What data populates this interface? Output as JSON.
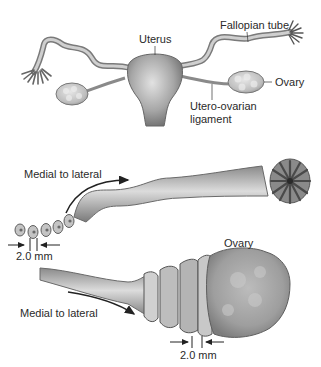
{
  "top_panel": {
    "labels": {
      "uterus": "Uterus",
      "fallopian_tube": "Fallopian tube",
      "ovary": "Ovary",
      "ligament_line1": "Utero-ovarian",
      "ligament_line2": "ligament"
    }
  },
  "middle_panel": {
    "direction_label": "Medial to lateral",
    "section_thickness": "2.0 mm"
  },
  "bottom_panel": {
    "ovary_label": "Ovary",
    "direction_label": "Medial to lateral",
    "section_thickness": "2.0 mm"
  },
  "colors": {
    "tissue_light": "#d9d9d9",
    "tissue_mid": "#a8a8a8",
    "tissue_dark": "#6e6e6e",
    "outline": "#555555",
    "text": "#2a2a2a"
  }
}
